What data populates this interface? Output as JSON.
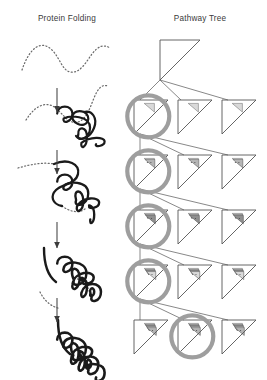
{
  "figure": {
    "width": 267,
    "height": 380,
    "background": "#ffffff",
    "panels": [
      {
        "id": "protein-folding",
        "title": "Protein Folding",
        "title_x": 67,
        "title_y": 20
      },
      {
        "id": "pathway-tree",
        "title": "Pathway Tree",
        "title_x": 200,
        "title_y": 20
      }
    ]
  },
  "colors": {
    "ink": "#1a1a1a",
    "chain_dotted": "#6b6b6b",
    "arrow": "#4a4a4a",
    "node_stroke": "#555555",
    "shade_light": "#d9d9d9",
    "shade_mid": "#b5b5b5",
    "shade_dark": "#8f8f8f",
    "highlight_ring": "#9e9e9e",
    "edge": "#6a6a6a",
    "title_text": "#3a3a3a"
  },
  "protein_folding": {
    "description": "Five-stage folding progression from extended dotted chain to compact bold coil",
    "stages": [
      {
        "index": 0,
        "label": "extended-chain",
        "folded_fraction": 0.0,
        "cx": 66,
        "cy": 56,
        "dotted_path": "M 22 70 C 30 46, 42 40, 52 50 C 60 58, 62 70, 70 72 C 80 74, 86 62, 92 54 C 98 46, 104 44, 110 48",
        "solid_path": ""
      },
      {
        "index": 1,
        "label": "partial-coil",
        "folded_fraction": 0.25,
        "cx": 66,
        "cy": 118,
        "dotted_path": "M 26 120 C 36 104, 48 100, 58 110 C 66 118, 70 124, 78 122 C 86 120, 90 108, 94 98 C 98 88, 102 84, 108 86",
        "solid_path": "M 84 112 C 72 108, 68 120, 78 124 C 88 128, 92 116, 84 112 M 84 112 C 92 110, 98 118, 94 128 C 90 138, 80 142, 76 136"
      },
      {
        "index": 2,
        "label": "loose-fold",
        "folded_fraction": 0.5,
        "cx": 66,
        "cy": 186,
        "dotted_path": "M 18 168 C 32 164, 44 162, 54 164 M 62 206 C 70 212, 80 214, 86 208",
        "solid_path": "M 54 164 C 68 158, 80 164, 78 174 C 76 184, 62 184, 56 190 C 50 196, 52 204, 62 206"
      },
      {
        "index": 3,
        "label": "compact-fold",
        "folded_fraction": 0.8,
        "cx": 66,
        "cy": 268,
        "dotted_path": "M 40 292 C 44 300, 50 306, 58 308 M 74 278 C 84 280, 90 288, 90 296",
        "solid_path": "M 44 248 C 44 264, 48 276, 56 282"
      },
      {
        "index": 4,
        "label": "native-state",
        "folded_fraction": 1.0,
        "cx": 66,
        "cy": 344,
        "dotted_path": "",
        "solid_path": "M 58 320 C 58 336, 62 348, 70 354"
      }
    ],
    "arrows": [
      {
        "x": 57,
        "y1": 88,
        "y2": 112
      },
      {
        "x": 57,
        "y1": 150,
        "y2": 174
      },
      {
        "x": 57,
        "y1": 222,
        "y2": 248
      },
      {
        "x": 57,
        "y1": 298,
        "y2": 322
      }
    ]
  },
  "pathway_tree": {
    "description": "Hierarchical tree of right-triangle state nodes; shading density grows with depth; gray rings mark the selected node at each level",
    "levels": 5,
    "root": {
      "level": 0,
      "x": 160,
      "y": 40,
      "size": 40,
      "shaded_cells": 0,
      "highlighted": false
    },
    "nodes": [
      {
        "level": 1,
        "index": 0,
        "x": 134,
        "y": 100,
        "size": 34,
        "shaded_cells": 1,
        "highlighted": true
      },
      {
        "level": 1,
        "index": 1,
        "x": 178,
        "y": 100,
        "size": 34,
        "shaded_cells": 1,
        "highlighted": false
      },
      {
        "level": 1,
        "index": 2,
        "x": 222,
        "y": 100,
        "size": 34,
        "shaded_cells": 1,
        "highlighted": false
      },
      {
        "level": 2,
        "index": 0,
        "x": 134,
        "y": 155,
        "size": 34,
        "shaded_cells": 2,
        "highlighted": true
      },
      {
        "level": 2,
        "index": 1,
        "x": 178,
        "y": 155,
        "size": 34,
        "shaded_cells": 2,
        "highlighted": false
      },
      {
        "level": 2,
        "index": 2,
        "x": 222,
        "y": 155,
        "size": 34,
        "shaded_cells": 2,
        "highlighted": false
      },
      {
        "level": 3,
        "index": 0,
        "x": 134,
        "y": 210,
        "size": 34,
        "shaded_cells": 3,
        "highlighted": true
      },
      {
        "level": 3,
        "index": 1,
        "x": 178,
        "y": 210,
        "size": 34,
        "shaded_cells": 3,
        "highlighted": false
      },
      {
        "level": 3,
        "index": 2,
        "x": 222,
        "y": 210,
        "size": 34,
        "shaded_cells": 3,
        "highlighted": false
      },
      {
        "level": 4,
        "index": 0,
        "x": 134,
        "y": 265,
        "size": 34,
        "shaded_cells": 4,
        "highlighted": true
      },
      {
        "level": 4,
        "index": 1,
        "x": 178,
        "y": 265,
        "size": 34,
        "shaded_cells": 4,
        "highlighted": false
      },
      {
        "level": 4,
        "index": 2,
        "x": 222,
        "y": 265,
        "size": 34,
        "shaded_cells": 4,
        "highlighted": false
      },
      {
        "level": 5,
        "index": 0,
        "x": 134,
        "y": 320,
        "size": 34,
        "shaded_cells": 5,
        "highlighted": false
      },
      {
        "level": 5,
        "index": 1,
        "x": 178,
        "y": 320,
        "size": 34,
        "shaded_cells": 5,
        "highlighted": true
      },
      {
        "level": 5,
        "index": 2,
        "x": 222,
        "y": 320,
        "size": 34,
        "shaded_cells": 5,
        "highlighted": false
      }
    ],
    "edges": [
      {
        "from": [
          160,
          80
        ],
        "to": [
          140,
          100
        ]
      },
      {
        "from": [
          160,
          80
        ],
        "to": [
          181,
          100
        ]
      },
      {
        "from": [
          160,
          80
        ],
        "to": [
          228,
          100
        ]
      },
      {
        "from": [
          140,
          134
        ],
        "to": [
          140,
          155
        ]
      },
      {
        "from": [
          140,
          134
        ],
        "to": [
          184,
          155
        ]
      },
      {
        "from": [
          140,
          134
        ],
        "to": [
          228,
          155
        ]
      },
      {
        "from": [
          140,
          189
        ],
        "to": [
          140,
          210
        ]
      },
      {
        "from": [
          140,
          189
        ],
        "to": [
          184,
          210
        ]
      },
      {
        "from": [
          140,
          189
        ],
        "to": [
          228,
          210
        ]
      },
      {
        "from": [
          140,
          244
        ],
        "to": [
          140,
          265
        ]
      },
      {
        "from": [
          140,
          244
        ],
        "to": [
          184,
          265
        ]
      },
      {
        "from": [
          140,
          244
        ],
        "to": [
          228,
          265
        ]
      },
      {
        "from": [
          140,
          299
        ],
        "to": [
          140,
          320
        ]
      },
      {
        "from": [
          140,
          299
        ],
        "to": [
          184,
          320
        ]
      },
      {
        "from": [
          140,
          299
        ],
        "to": [
          228,
          320
        ]
      }
    ],
    "highlight_radius": 21,
    "highlight_stroke_width": 4.2
  }
}
